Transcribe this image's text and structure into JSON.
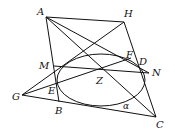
{
  "diagram": {
    "type": "geometry",
    "stroke_color": "#111111",
    "background": "#ffffff",
    "points": {
      "A": {
        "label": "A",
        "x": 46,
        "y": 17
      },
      "H": {
        "label": "H",
        "x": 124,
        "y": 22
      },
      "C": {
        "label": "C",
        "x": 156,
        "y": 117
      },
      "B": {
        "label": "B",
        "x": 59,
        "y": 102
      },
      "G": {
        "label": "G",
        "x": 22,
        "y": 95
      },
      "M": {
        "label": "M",
        "x": 54,
        "y": 66
      },
      "N": {
        "label": "N",
        "x": 149,
        "y": 73
      },
      "E": {
        "label": "E",
        "x": 57,
        "y": 88
      },
      "F": {
        "label": "F",
        "x": 131,
        "y": 58
      },
      "D": {
        "label": "D",
        "x": 139,
        "y": 63
      },
      "Z": {
        "label": "Z",
        "x": 103,
        "y": 69
      }
    },
    "ellipse": {
      "cx": 101,
      "cy": 80,
      "rx": 44,
      "ry": 26
    },
    "angle_label": "α",
    "labels": [
      {
        "text": "A",
        "x": 37,
        "y": 7
      },
      {
        "text": "H",
        "x": 124,
        "y": 9
      },
      {
        "text": "F",
        "x": 126,
        "y": 51
      },
      {
        "text": "D",
        "x": 139,
        "y": 57
      },
      {
        "text": "M",
        "x": 40,
        "y": 61
      },
      {
        "text": "N",
        "x": 152,
        "y": 68
      },
      {
        "text": "Z",
        "x": 96,
        "y": 76
      },
      {
        "text": "G",
        "x": 12,
        "y": 92
      },
      {
        "text": "E",
        "x": 48,
        "y": 86
      },
      {
        "text": "B",
        "x": 55,
        "y": 106
      },
      {
        "text": "α",
        "x": 123,
        "y": 102
      },
      {
        "text": "C",
        "x": 156,
        "y": 119
      }
    ]
  }
}
